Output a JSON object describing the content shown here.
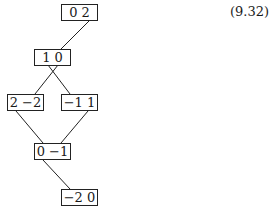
{
  "equation_number": "(9.32)",
  "nodes": [
    {
      "id": "n1",
      "label": "0  2",
      "x": 61,
      "y": 4
    },
    {
      "id": "n2",
      "label": "1  0",
      "x": 34,
      "y": 49
    },
    {
      "id": "n3",
      "label": "2 −2",
      "x": 7,
      "y": 94
    },
    {
      "id": "n4",
      "label": "−1 1",
      "x": 61,
      "y": 94
    },
    {
      "id": "n5",
      "label": "0 −1",
      "x": 34,
      "y": 143
    },
    {
      "id": "n6",
      "label": "−2 0",
      "x": 61,
      "y": 189
    }
  ],
  "edges": [
    {
      "from": "n1",
      "to": "n2"
    },
    {
      "from": "n2",
      "to": "n3"
    },
    {
      "from": "n2",
      "to": "n4"
    },
    {
      "from": "n3",
      "to": "n5"
    },
    {
      "from": "n4",
      "to": "n5"
    },
    {
      "from": "n5",
      "to": "n6"
    }
  ]
}
